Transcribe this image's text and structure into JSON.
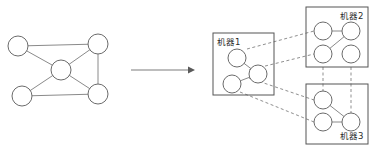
{
  "figure": {
    "title": "",
    "type": "graph-partitioning-diagram",
    "colors": {
      "background": "#ffffff",
      "node_stroke": "#6b6b6b",
      "node_fill": "#ffffff",
      "edge": "#8a8a8a",
      "box_stroke": "#555555",
      "dashed_edge": "#8f8f8f",
      "arrow": "#5a5a5a",
      "label_text": "#2a2a2a"
    }
  },
  "source_graph": {
    "name": "original-graph",
    "nodes": [
      {
        "id": "n1",
        "cx": 18,
        "cy": 46,
        "r": 10
      },
      {
        "id": "n2",
        "cx": 98,
        "cy": 44,
        "r": 10
      },
      {
        "id": "n3",
        "cx": 61,
        "cy": 70,
        "r": 10
      },
      {
        "id": "n4",
        "cx": 22,
        "cy": 96,
        "r": 10
      },
      {
        "id": "n5",
        "cx": 98,
        "cy": 94,
        "r": 10
      }
    ],
    "edges": [
      {
        "from": "n1",
        "to": "n2"
      },
      {
        "from": "n1",
        "to": "n3"
      },
      {
        "from": "n3",
        "to": "n2"
      },
      {
        "from": "n3",
        "to": "n4"
      },
      {
        "from": "n3",
        "to": "n5"
      },
      {
        "from": "n2",
        "to": "n5"
      },
      {
        "from": "n4",
        "to": "n5"
      }
    ]
  },
  "arrow": {
    "label": "",
    "x1": 131,
    "y1": 70,
    "x2": 191,
    "y2": 70
  },
  "machines": [
    {
      "id": "machine1",
      "label": "机器1",
      "label_x": 217,
      "label_y": 45,
      "box": {
        "x": 213,
        "y": 33,
        "w": 61,
        "h": 62
      },
      "nodes": [
        {
          "id": "m1a",
          "cx": 237,
          "cy": 58,
          "r": 9
        },
        {
          "id": "m1b",
          "cx": 258,
          "cy": 74,
          "r": 9
        },
        {
          "id": "m1c",
          "cx": 232,
          "cy": 84,
          "r": 9
        }
      ],
      "edges": [
        {
          "from": "m1a",
          "to": "m1b"
        },
        {
          "from": "m1b",
          "to": "m1c"
        }
      ]
    },
    {
      "id": "machine2",
      "label": "机器2",
      "label_x": 345,
      "label_y": 17,
      "box": {
        "x": 306,
        "y": 7,
        "w": 62,
        "h": 60
      },
      "nodes": [
        {
          "id": "m2a",
          "cx": 323,
          "cy": 31,
          "r": 9
        },
        {
          "id": "m2b",
          "cx": 351,
          "cy": 31,
          "r": 9
        },
        {
          "id": "m2c",
          "cx": 323,
          "cy": 54,
          "r": 9
        },
        {
          "id": "m2d",
          "cx": 351,
          "cy": 54,
          "r": 9
        }
      ],
      "edges": [
        {
          "from": "m2a",
          "to": "m2b"
        },
        {
          "from": "m2b",
          "to": "m2c"
        }
      ]
    },
    {
      "id": "machine3",
      "label": "机器3",
      "label_x": 345,
      "label_y": 137,
      "box": {
        "x": 306,
        "y": 84,
        "w": 62,
        "h": 60
      },
      "nodes": [
        {
          "id": "m3a",
          "cx": 323,
          "cy": 100,
          "r": 9
        },
        {
          "id": "m3b",
          "cx": 323,
          "cy": 122,
          "r": 9
        },
        {
          "id": "m3c",
          "cx": 351,
          "cy": 122,
          "r": 9
        }
      ],
      "edges": [
        {
          "from": "m3a",
          "to": "m3c"
        },
        {
          "from": "m3b",
          "to": "m3c"
        }
      ]
    }
  ],
  "cross_machine_edges": [
    {
      "from": "machine1",
      "to": "machine2",
      "x1": 247,
      "y1": 49,
      "x2": 314,
      "y2": 31
    },
    {
      "from": "machine1",
      "to": "machine2",
      "x1": 249,
      "y1": 70,
      "x2": 314,
      "y2": 54
    },
    {
      "from": "machine1",
      "to": "machine3",
      "x1": 249,
      "y1": 78,
      "x2": 314,
      "y2": 100
    },
    {
      "from": "machine1",
      "to": "machine3",
      "x1": 240,
      "y1": 92,
      "x2": 314,
      "y2": 122
    },
    {
      "from": "machine2",
      "to": "machine3",
      "x1": 323,
      "y1": 67,
      "x2": 323,
      "y2": 92
    },
    {
      "from": "machine2",
      "to": "machine3",
      "x1": 351,
      "y1": 67,
      "x2": 351,
      "y2": 113
    }
  ]
}
